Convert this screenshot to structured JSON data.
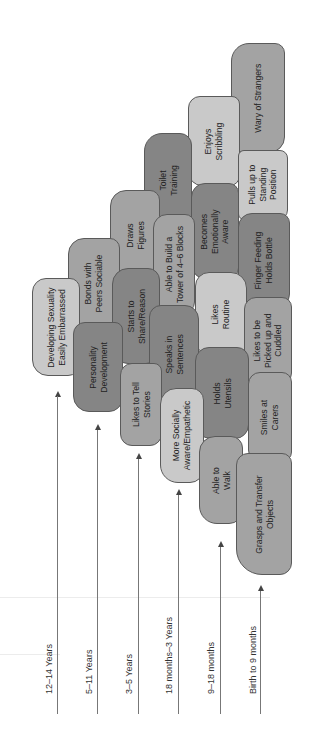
{
  "diagram": {
    "title_orientation": "rotated-90-ccw",
    "age_bands": [
      {
        "label": "12–14 Years"
      },
      {
        "label": "5–11 Years"
      },
      {
        "label": "3–5 Years"
      },
      {
        "label": "18 months–3 Years"
      },
      {
        "label": "9–18 months"
      },
      {
        "label": "Birth to 9 months"
      }
    ],
    "stones": [
      {
        "text": "Wary of Strangers",
        "shade": "mid"
      },
      {
        "text": "Enjoys\nScribbling",
        "shade": "light"
      },
      {
        "text": "Pulls up to\nStanding\nPosition",
        "shade": "light"
      },
      {
        "text": "Toilet\nTraining",
        "shade": "dark"
      },
      {
        "text": "Becomes\nEmotionally\nAware",
        "shade": "dark"
      },
      {
        "text": "Finger Feeding\nHolds Bottle",
        "shade": "dark"
      },
      {
        "text": "Draws\nFigures",
        "shade": "mid"
      },
      {
        "text": "Able to Build a\nTower of 4–6 Blocks",
        "shade": "mid"
      },
      {
        "text": "Likes\nRoutine",
        "shade": "light"
      },
      {
        "text": "Likes to be\nPicked up and\nCuddled",
        "shade": "mid"
      },
      {
        "text": "Bonds with\nPeers Sociable",
        "shade": "mid"
      },
      {
        "text": "Starts to\nShare/Reason",
        "shade": "dark"
      },
      {
        "text": "Speaks in\nSentences",
        "shade": "dark"
      },
      {
        "text": "Holds\nUtensils",
        "shade": "dark"
      },
      {
        "text": "Smiles at\nCarers",
        "shade": "mid"
      },
      {
        "text": "Developing Sexuality\nEasily Embarrassed",
        "shade": "light"
      },
      {
        "text": "Personality\nDevelopment",
        "shade": "dark"
      },
      {
        "text": "Likes to Tell\nStories",
        "shade": "mid"
      },
      {
        "text": "More Socially\nAware/Empathetic",
        "shade": "light"
      },
      {
        "text": "Able to\nWalk",
        "shade": "mid"
      },
      {
        "text": "Grasps and Transfer\nObjects",
        "shade": "mid"
      }
    ]
  }
}
